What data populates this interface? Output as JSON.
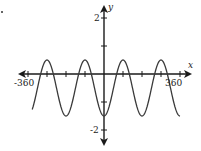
{
  "figure": {
    "marker": "."
  },
  "chart_data": {
    "type": "line",
    "title": "",
    "xlabel": "x",
    "ylabel": "y",
    "x_tick_labels": [
      "-360",
      "360"
    ],
    "y_tick_labels": [
      "2",
      "-2"
    ],
    "xlim": [
      -360,
      360
    ],
    "ylim": [
      -2,
      2
    ],
    "x_tick_step": 90,
    "y_tick_step": 1,
    "grid": false,
    "function": "y = -cos(2x) - 0.5",
    "series": [
      {
        "name": "curve",
        "x": [
          -315,
          -270,
          -225,
          -180,
          -135,
          -90,
          -45,
          0,
          45,
          90,
          135,
          180,
          225,
          270,
          315,
          360
        ],
        "values": [
          -0.5,
          0.5,
          -0.5,
          -1.5,
          -0.5,
          0.5,
          -0.5,
          -1.5,
          -0.5,
          0.5,
          -0.5,
          -1.5,
          -0.5,
          0.5,
          -0.5,
          -1.5
        ]
      }
    ],
    "colors": {
      "axis": "#1a1a1a",
      "curve": "#3a3a3a"
    }
  }
}
